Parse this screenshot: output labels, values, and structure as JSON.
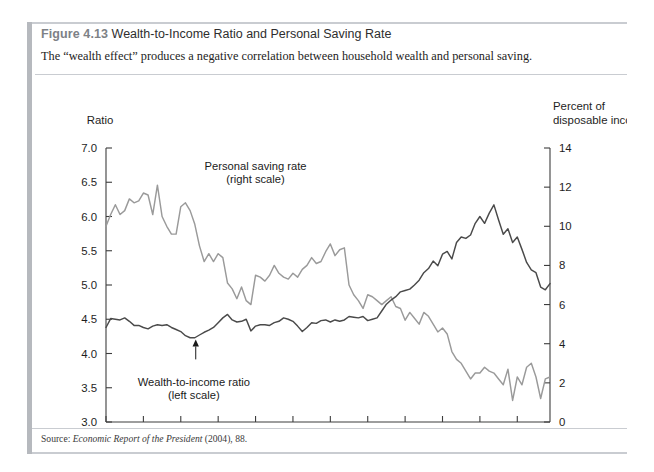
{
  "figure": {
    "number": "Figure 4.13",
    "title": "Wealth-to-Income Ratio and Personal Saving Rate",
    "subtitle": "The “wealth effect” produces a negative correlation between household wealth and personal saving.",
    "source_prefix": "Source: ",
    "source_italic": "Economic Report of the President",
    "source_suffix": " (2004), 88."
  },
  "colors": {
    "saving_rate_line": "#9a9a9a",
    "wealth_ratio_line": "#4a4a4a",
    "axis": "#3d3d3d",
    "rule": "#c9ccd1",
    "left_bar": "#b6b9be"
  },
  "chart_data": {
    "type": "line",
    "title": "Wealth-to-Income Ratio and Personal Saving Rate",
    "xlabel": "",
    "ylabel": "Ratio",
    "y2label": "Percent of disposable income",
    "y_axis_title_lines": [
      "Ratio"
    ],
    "y2_axis_title_lines": [
      "Percent of",
      "disposable income"
    ],
    "grid": false,
    "legend": "annotations",
    "xlim": [
      1980,
      2003.75
    ],
    "ylim": [
      3.0,
      7.0
    ],
    "y2lim": [
      0,
      14
    ],
    "yticks": [
      "3.0",
      "3.5",
      "4.0",
      "4.5",
      "5.0",
      "5.5",
      "6.0",
      "6.5",
      "7.0"
    ],
    "ytick_values": [
      3.0,
      3.5,
      4.0,
      4.5,
      5.0,
      5.5,
      6.0,
      6.5,
      7.0
    ],
    "y2ticks": [
      "0",
      "2",
      "4",
      "6",
      "8",
      "10",
      "12",
      "14"
    ],
    "y2tick_values": [
      0,
      2,
      4,
      6,
      8,
      10,
      12,
      14
    ],
    "xticks": [
      "1980",
      "1982",
      "1984",
      "1986",
      "1988",
      "1990",
      "1992",
      "1994",
      "1996",
      "1998",
      "2000",
      "2002"
    ],
    "xtick_values": [
      1980,
      1982,
      1984,
      1986,
      1988,
      1990,
      1992,
      1994,
      1996,
      1998,
      2000,
      2002
    ],
    "annotations": [
      {
        "text_lines": [
          "Personal saving rate",
          "(right scale)"
        ],
        "points_to_series": "Personal saving rate",
        "x": 1988.0,
        "y2": 7.7,
        "label_x": 1988.0,
        "label_y2": 12.9
      },
      {
        "text_lines": [
          "Wealth-to-income ratio",
          "(left scale)"
        ],
        "points_to_series": "Wealth-to-income ratio",
        "x": 1984.8,
        "y": 4.22,
        "label_x": 1984.7,
        "label_y": 3.52
      }
    ],
    "series": [
      {
        "name": "Personal saving rate",
        "axis": "right",
        "color": "#9a9a9a",
        "unit": "percent of disposable income",
        "x": [
          1980.0,
          1980.25,
          1980.5,
          1980.75,
          1981.0,
          1981.25,
          1981.5,
          1981.75,
          1982.0,
          1982.25,
          1982.5,
          1982.75,
          1983.0,
          1983.25,
          1983.5,
          1983.75,
          1984.0,
          1984.25,
          1984.5,
          1984.75,
          1985.0,
          1985.25,
          1985.5,
          1985.75,
          1986.0,
          1986.25,
          1986.5,
          1986.75,
          1987.0,
          1987.25,
          1987.5,
          1987.75,
          1988.0,
          1988.25,
          1988.5,
          1988.75,
          1989.0,
          1989.25,
          1989.5,
          1989.75,
          1990.0,
          1990.25,
          1990.5,
          1990.75,
          1991.0,
          1991.25,
          1991.5,
          1991.75,
          1992.0,
          1992.25,
          1992.5,
          1992.75,
          1993.0,
          1993.25,
          1993.5,
          1993.75,
          1994.0,
          1994.25,
          1994.5,
          1994.75,
          1995.0,
          1995.25,
          1995.5,
          1995.75,
          1996.0,
          1996.25,
          1996.5,
          1996.75,
          1997.0,
          1997.25,
          1997.5,
          1997.75,
          1998.0,
          1998.25,
          1998.5,
          1998.75,
          1999.0,
          1999.25,
          1999.5,
          1999.75,
          2000.0,
          2000.25,
          2000.5,
          2000.75,
          2001.0,
          2001.25,
          2001.5,
          2001.75,
          2002.0,
          2002.25,
          2002.5,
          2002.75,
          2003.0,
          2003.25,
          2003.5,
          2003.75
        ],
        "values": [
          10.0,
          10.6,
          11.1,
          10.6,
          10.8,
          11.4,
          11.2,
          11.3,
          11.7,
          11.6,
          10.6,
          12.1,
          10.5,
          10.0,
          9.6,
          9.6,
          11.0,
          11.2,
          10.8,
          10.1,
          9.0,
          8.2,
          8.6,
          8.2,
          8.6,
          8.4,
          7.1,
          6.8,
          6.3,
          6.9,
          6.2,
          6.0,
          7.5,
          7.4,
          7.2,
          7.5,
          8.0,
          7.6,
          7.4,
          7.3,
          7.6,
          7.4,
          7.8,
          8.0,
          8.4,
          8.1,
          8.2,
          8.7,
          9.1,
          8.5,
          8.8,
          8.9,
          7.0,
          6.5,
          6.2,
          5.8,
          6.5,
          6.4,
          6.2,
          6.0,
          6.2,
          6.4,
          5.9,
          5.8,
          5.2,
          5.6,
          5.3,
          5.0,
          5.6,
          5.4,
          5.0,
          4.6,
          4.8,
          4.5,
          3.6,
          3.2,
          3.0,
          2.6,
          2.2,
          2.5,
          2.5,
          2.8,
          2.6,
          2.5,
          2.2,
          1.9,
          2.7,
          1.1,
          2.3,
          1.9,
          2.8,
          3.0,
          2.3,
          1.2,
          2.2,
          2.3
        ]
      },
      {
        "name": "Wealth-to-income ratio",
        "axis": "left",
        "color": "#4a4a4a",
        "unit": "ratio",
        "x": [
          1980.0,
          1980.25,
          1980.5,
          1980.75,
          1981.0,
          1981.25,
          1981.5,
          1981.75,
          1982.0,
          1982.25,
          1982.5,
          1982.75,
          1983.0,
          1983.25,
          1983.5,
          1983.75,
          1984.0,
          1984.25,
          1984.5,
          1984.75,
          1985.0,
          1985.25,
          1985.5,
          1985.75,
          1986.0,
          1986.25,
          1986.5,
          1986.75,
          1987.0,
          1987.25,
          1987.5,
          1987.75,
          1988.0,
          1988.25,
          1988.5,
          1988.75,
          1989.0,
          1989.25,
          1989.5,
          1989.75,
          1990.0,
          1990.25,
          1990.5,
          1990.75,
          1991.0,
          1991.25,
          1991.5,
          1991.75,
          1992.0,
          1992.25,
          1992.5,
          1992.75,
          1993.0,
          1993.25,
          1993.5,
          1993.75,
          1994.0,
          1994.25,
          1994.5,
          1994.75,
          1995.0,
          1995.25,
          1995.5,
          1995.75,
          1996.0,
          1996.25,
          1996.5,
          1996.75,
          1997.0,
          1997.25,
          1997.5,
          1997.75,
          1998.0,
          1998.25,
          1998.5,
          1998.75,
          1999.0,
          1999.25,
          1999.5,
          1999.75,
          2000.0,
          2000.25,
          2000.5,
          2000.75,
          2001.0,
          2001.25,
          2001.5,
          2001.75,
          2002.0,
          2002.25,
          2002.5,
          2002.75,
          2003.0,
          2003.25,
          2003.5,
          2003.75
        ],
        "values": [
          4.38,
          4.51,
          4.5,
          4.49,
          4.52,
          4.47,
          4.41,
          4.41,
          4.38,
          4.36,
          4.4,
          4.42,
          4.41,
          4.42,
          4.38,
          4.35,
          4.32,
          4.26,
          4.23,
          4.23,
          4.27,
          4.31,
          4.34,
          4.38,
          4.45,
          4.52,
          4.57,
          4.49,
          4.46,
          4.47,
          4.5,
          4.33,
          4.4,
          4.42,
          4.42,
          4.41,
          4.45,
          4.47,
          4.52,
          4.5,
          4.47,
          4.4,
          4.32,
          4.38,
          4.45,
          4.44,
          4.48,
          4.49,
          4.46,
          4.49,
          4.47,
          4.49,
          4.54,
          4.53,
          4.52,
          4.54,
          4.48,
          4.5,
          4.52,
          4.62,
          4.72,
          4.78,
          4.83,
          4.9,
          4.92,
          4.94,
          5.0,
          5.07,
          5.18,
          5.24,
          5.35,
          5.28,
          5.45,
          5.49,
          5.38,
          5.62,
          5.7,
          5.68,
          5.73,
          5.9,
          6.0,
          5.9,
          6.05,
          6.17,
          5.95,
          5.74,
          5.82,
          5.62,
          5.7,
          5.52,
          5.33,
          5.22,
          5.18,
          4.97,
          4.93,
          5.02
        ]
      }
    ]
  }
}
